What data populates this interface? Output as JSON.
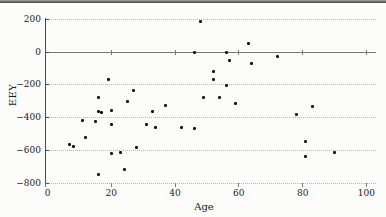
{
  "chart_data": {
    "type": "scatter",
    "xlabel": "Age",
    "ylabel": "EEY",
    "xlim": [
      0,
      103
    ],
    "ylim": [
      -800,
      200
    ],
    "grid": "horizontal-dotted",
    "zero_axis_solid": true,
    "legend": "none",
    "marker": {
      "shape": "filled-dot",
      "color": "#101010"
    },
    "xticks": [
      {
        "v": 0,
        "label": "0"
      },
      {
        "v": 20,
        "label": "20"
      },
      {
        "v": 40,
        "label": "40"
      },
      {
        "v": 60,
        "label": "60"
      },
      {
        "v": 80,
        "label": "80"
      },
      {
        "v": 100,
        "label": "100"
      }
    ],
    "yticks": [
      {
        "v": 200,
        "label": "200"
      },
      {
        "v": 0,
        "label": "0"
      },
      {
        "v": -200,
        "label": "−200"
      },
      {
        "v": -400,
        "label": "−400"
      },
      {
        "v": -600,
        "label": "−600"
      },
      {
        "v": -800,
        "label": "−800"
      }
    ],
    "points": [
      [
        7,
        -565
      ],
      [
        8,
        -575
      ],
      [
        11,
        -420
      ],
      [
        12,
        -520
      ],
      [
        15,
        -425
      ],
      [
        16,
        -745
      ],
      [
        16,
        -280
      ],
      [
        16,
        -360
      ],
      [
        17,
        -370
      ],
      [
        19,
        -165
      ],
      [
        20,
        -355
      ],
      [
        20,
        -440
      ],
      [
        20,
        -620
      ],
      [
        23,
        -610
      ],
      [
        24,
        -715
      ],
      [
        25,
        -300
      ],
      [
        27,
        -235
      ],
      [
        28,
        -580
      ],
      [
        31,
        -440
      ],
      [
        33,
        -365
      ],
      [
        34,
        -460
      ],
      [
        37,
        -325
      ],
      [
        42,
        -460
      ],
      [
        46,
        -5
      ],
      [
        46,
        -465
      ],
      [
        48,
        185
      ],
      [
        49,
        -280
      ],
      [
        52,
        -120
      ],
      [
        52,
        -170
      ],
      [
        54,
        -280
      ],
      [
        56,
        -5
      ],
      [
        56,
        -205
      ],
      [
        57,
        -50
      ],
      [
        59,
        -315
      ],
      [
        63,
        50
      ],
      [
        64,
        -70
      ],
      [
        72,
        -30
      ],
      [
        78,
        -380
      ],
      [
        81,
        -545
      ],
      [
        81,
        -640
      ],
      [
        83,
        -330
      ],
      [
        90,
        -615
      ]
    ]
  }
}
